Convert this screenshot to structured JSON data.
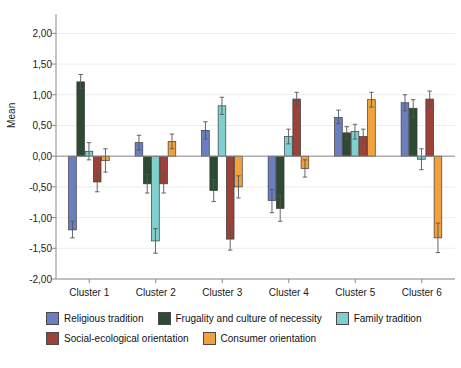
{
  "chart_data": {
    "type": "bar",
    "title": "",
    "xlabel": "",
    "ylabel": "Mean",
    "ylim": [
      -2.0,
      2.25
    ],
    "ytick_labels": [
      "2,00",
      "1,50",
      "1,00",
      "0,50",
      "0,00",
      "-0,50",
      "-1,00",
      "-1,50",
      "-2,00"
    ],
    "ytick_values": [
      2.0,
      1.5,
      1.0,
      0.5,
      0.0,
      -0.5,
      -1.0,
      -1.5,
      -2.0
    ],
    "grid": true,
    "legend_position": "bottom-left",
    "error_bars": true,
    "categories": [
      "Cluster 1",
      "Cluster 2",
      "Cluster 3",
      "Cluster 4",
      "Cluster 5",
      "Cluster 6"
    ],
    "series": [
      {
        "name": "Religious tradition",
        "color": "#6B7FC0",
        "values": [
          -1.2,
          0.22,
          0.42,
          -0.72,
          0.63,
          0.87
        ],
        "err_low": [
          -1.33,
          0.1,
          0.28,
          -0.92,
          0.53,
          0.74
        ],
        "err_high": [
          -1.06,
          0.34,
          0.56,
          -0.54,
          0.75,
          1.0
        ]
      },
      {
        "name": "Frugality and culture of necessity",
        "color": "#2D4A33",
        "values": [
          1.21,
          -0.45,
          -0.56,
          -0.85,
          0.38,
          0.78
        ],
        "err_low": [
          1.1,
          -0.6,
          -0.74,
          -1.06,
          0.28,
          0.64
        ],
        "err_high": [
          1.33,
          -0.3,
          -0.38,
          -0.64,
          0.48,
          0.92
        ]
      },
      {
        "name": "Family tradition",
        "color": "#7FCFCF",
        "values": [
          0.08,
          -1.38,
          0.82,
          0.32,
          0.4,
          -0.05
        ],
        "err_low": [
          -0.06,
          -1.58,
          0.68,
          0.2,
          0.28,
          -0.22
        ],
        "err_high": [
          0.22,
          -1.18,
          0.96,
          0.44,
          0.52,
          0.12
        ]
      },
      {
        "name": "Social-ecological orientation",
        "color": "#9C4238",
        "values": [
          -0.42,
          -0.45,
          -1.35,
          0.93,
          0.32,
          0.93
        ],
        "err_low": [
          -0.58,
          -0.6,
          -1.53,
          0.82,
          0.2,
          0.8
        ],
        "err_high": [
          -0.26,
          -0.3,
          -1.17,
          1.04,
          0.44,
          1.06
        ]
      },
      {
        "name": "Consumer orientation",
        "color": "#F2A23C",
        "values": [
          -0.07,
          0.24,
          -0.5,
          -0.2,
          0.92,
          -1.33
        ],
        "err_low": [
          -0.26,
          0.12,
          -0.68,
          -0.34,
          0.8,
          -1.57
        ],
        "err_high": [
          0.12,
          0.36,
          -0.32,
          -0.06,
          1.04,
          -1.09
        ]
      }
    ]
  },
  "legend": {
    "items": [
      {
        "label": "Religious tradition",
        "color": "#6B7FC0"
      },
      {
        "label": "Frugality and culture of necessity",
        "color": "#2D4A33"
      },
      {
        "label": "Family tradition",
        "color": "#7FCFCF"
      },
      {
        "label": "Social-ecological orientation",
        "color": "#9C4238"
      },
      {
        "label": "Consumer orientation",
        "color": "#F2A23C"
      }
    ]
  }
}
